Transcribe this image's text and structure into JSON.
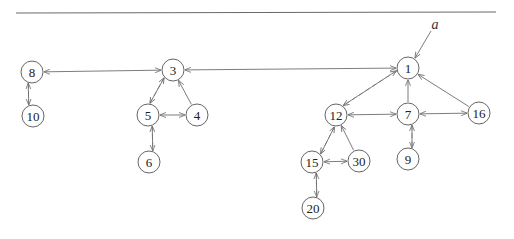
{
  "diagram": {
    "type": "directed-graph",
    "top_rule": {
      "x1": 16,
      "y1": 13,
      "x2": 496,
      "y2": 12
    },
    "node_radius": 11,
    "annotation": {
      "label": "a",
      "x": 435,
      "y": 24,
      "arrow_from": [
        431,
        31
      ],
      "arrow_to": [
        415,
        58
      ]
    },
    "nodes": [
      {
        "id": "1",
        "label": "1",
        "x": 408,
        "y": 68
      },
      {
        "id": "3",
        "label": "3",
        "x": 173,
        "y": 70
      },
      {
        "id": "8",
        "label": "8",
        "x": 32,
        "y": 72
      },
      {
        "id": "10",
        "label": "10",
        "x": 33,
        "y": 116
      },
      {
        "id": "5",
        "label": "5",
        "x": 148,
        "y": 115
      },
      {
        "id": "4",
        "label": "4",
        "x": 197,
        "y": 115
      },
      {
        "id": "6",
        "label": "6",
        "x": 149,
        "y": 162
      },
      {
        "id": "12",
        "label": "12",
        "x": 336,
        "y": 115
      },
      {
        "id": "7",
        "label": "7",
        "x": 408,
        "y": 114
      },
      {
        "id": "16",
        "label": "16",
        "x": 479,
        "y": 113
      },
      {
        "id": "9",
        "label": "9",
        "x": 408,
        "y": 159
      },
      {
        "id": "15",
        "label": "15",
        "x": 312,
        "y": 162
      },
      {
        "id": "30",
        "label": "30",
        "x": 359,
        "y": 161
      },
      {
        "id": "20",
        "label": "20",
        "x": 313,
        "y": 208
      }
    ],
    "edges": [
      {
        "from": "8",
        "to": "3",
        "style": "solid",
        "bidirectional": true,
        "offset": 0
      },
      {
        "from": "3",
        "to": "1",
        "style": "solid",
        "bidirectional": true,
        "offset": 0
      },
      {
        "from": "8",
        "to": "10",
        "style": "dashed",
        "bidirectional": false,
        "offset": -4
      },
      {
        "from": "10",
        "to": "8",
        "style": "solid",
        "bidirectional": false,
        "offset": -4
      },
      {
        "from": "3",
        "to": "5",
        "style": "dashed",
        "bidirectional": false,
        "offset": 4
      },
      {
        "from": "5",
        "to": "3",
        "style": "solid",
        "bidirectional": false,
        "offset": 4
      },
      {
        "from": "4",
        "to": "3",
        "style": "solid",
        "bidirectional": false,
        "offset": 0
      },
      {
        "from": "5",
        "to": "4",
        "style": "solid",
        "bidirectional": true,
        "offset": 0
      },
      {
        "from": "5",
        "to": "6",
        "style": "dashed",
        "bidirectional": false,
        "offset": -4
      },
      {
        "from": "6",
        "to": "5",
        "style": "solid",
        "bidirectional": false,
        "offset": -4
      },
      {
        "from": "1",
        "to": "12",
        "style": "dashed",
        "bidirectional": false,
        "offset": 4
      },
      {
        "from": "12",
        "to": "1",
        "style": "solid",
        "bidirectional": false,
        "offset": 4
      },
      {
        "from": "7",
        "to": "1",
        "style": "solid",
        "bidirectional": false,
        "offset": 0
      },
      {
        "from": "16",
        "to": "1",
        "style": "solid",
        "bidirectional": false,
        "offset": 0
      },
      {
        "from": "12",
        "to": "7",
        "style": "solid",
        "bidirectional": true,
        "offset": 0
      },
      {
        "from": "7",
        "to": "16",
        "style": "solid",
        "bidirectional": true,
        "offset": 0
      },
      {
        "from": "7",
        "to": "9",
        "style": "dashed",
        "bidirectional": false,
        "offset": -4
      },
      {
        "from": "9",
        "to": "7",
        "style": "solid",
        "bidirectional": false,
        "offset": -4
      },
      {
        "from": "12",
        "to": "15",
        "style": "dashed",
        "bidirectional": false,
        "offset": -4
      },
      {
        "from": "15",
        "to": "12",
        "style": "solid",
        "bidirectional": false,
        "offset": -4
      },
      {
        "from": "30",
        "to": "12",
        "style": "solid",
        "bidirectional": false,
        "offset": 0
      },
      {
        "from": "15",
        "to": "30",
        "style": "solid",
        "bidirectional": true,
        "offset": 0
      },
      {
        "from": "15",
        "to": "20",
        "style": "dashed",
        "bidirectional": false,
        "offset": -4
      },
      {
        "from": "20",
        "to": "15",
        "style": "solid",
        "bidirectional": false,
        "offset": -4
      }
    ]
  }
}
